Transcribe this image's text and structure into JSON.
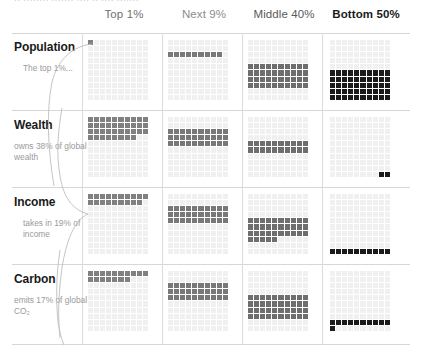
{
  "top_clipped_text": "·· ········ ······· ···· ·· ···· ·······",
  "columns": [
    {
      "label": "Top 1%",
      "color": "#808080",
      "header_color": "#6f6f6f",
      "bold": false
    },
    {
      "label": "Next 9%",
      "color": "#787878",
      "header_color": "#8c8c8c",
      "bold": false
    },
    {
      "label": "Middle 40%",
      "color": "#6e6e6e",
      "header_color": "#5a5a5a",
      "bold": false
    },
    {
      "label": "Bottom 50%",
      "color": "#1a1a1a",
      "header_color": "#1a1a1a",
      "bold": true
    }
  ],
  "empty_cell_color": "#f0f0f0",
  "rows": [
    {
      "title": "Population",
      "note": "The top 1%...",
      "note_indent": true,
      "values": [
        1,
        9,
        40,
        50
      ]
    },
    {
      "title": "Wealth",
      "note": "owns 38% of global wealth",
      "note_indent": false,
      "values": [
        38,
        30,
        20,
        2
      ]
    },
    {
      "title": "Income",
      "note": "takes in 19% of income",
      "note_indent": true,
      "values": [
        19,
        30,
        35,
        10
      ]
    },
    {
      "title": "Carbon",
      "note": "emits 17% of global CO₂",
      "note_indent": false,
      "values": [
        17,
        30,
        40,
        11
      ]
    }
  ],
  "chart_data": {
    "type": "heatmap",
    "title": "",
    "subtitle": "",
    "xlabel": "",
    "ylabel": "",
    "grid": true,
    "legend": "none",
    "categories": [
      "Top 1%",
      "Next 9%",
      "Middle 40%",
      "Bottom 50%"
    ],
    "series": [
      {
        "name": "Population",
        "values": [
          1,
          9,
          40,
          50
        ]
      },
      {
        "name": "Wealth",
        "values": [
          38,
          30,
          20,
          2
        ]
      },
      {
        "name": "Income",
        "values": [
          19,
          30,
          35,
          10
        ]
      },
      {
        "name": "Carbon",
        "values": [
          17,
          30,
          40,
          11
        ]
      }
    ],
    "units": "percent",
    "ylim": [
      0,
      100
    ],
    "annotations": [
      "The top 1%...",
      "owns 38% of global wealth",
      "takes in 19% of income",
      "emits 17% of global CO₂"
    ]
  }
}
